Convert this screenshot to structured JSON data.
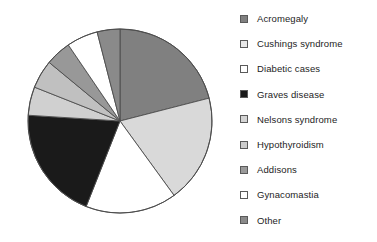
{
  "chart_data": {
    "type": "pie",
    "title": "",
    "legend_position": "right",
    "start_angle_deg": 0,
    "direction": "clockwise",
    "categories": [
      "Acromegaly",
      "Cushings syndrome",
      "Diabetic cases",
      "Graves disease",
      "Nelsons syndrome",
      "Hypothyroidism",
      "Addisons",
      "Gynacomastia",
      "Other"
    ],
    "values": [
      21,
      19,
      16,
      20,
      5,
      5,
      4.5,
      5.5,
      4
    ],
    "slice_angles_deg": [
      75.6,
      68.4,
      57.6,
      72,
      18,
      18,
      16.2,
      19.8,
      14.4
    ],
    "colors": [
      "#808080",
      "#d9d9d9",
      "#ffffff",
      "#1a1a1a",
      "#d0d0d0",
      "#c0c0c0",
      "#989898",
      "#ffffff",
      "#8a8a8a"
    ],
    "slice_border_color": "#4d4d4d",
    "center": {
      "x": 120,
      "y": 121
    },
    "radius": 92
  },
  "legend": {
    "items": [
      {
        "label": "Acromegaly",
        "color": "#808080"
      },
      {
        "label": "Cushings syndrome",
        "color": "#e8e8e8"
      },
      {
        "label": "Diabetic cases",
        "color": "#ffffff"
      },
      {
        "label": "Graves disease",
        "color": "#1a1a1a"
      },
      {
        "label": "Nelsons syndrome",
        "color": "#d4d4d4"
      },
      {
        "label": "Hypothyroidism",
        "color": "#cccccc"
      },
      {
        "label": "Addisons",
        "color": "#9a9a9a"
      },
      {
        "label": "Gynacomastia",
        "color": "#ffffff"
      },
      {
        "label": "Other",
        "color": "#8a8a8a"
      }
    ]
  }
}
